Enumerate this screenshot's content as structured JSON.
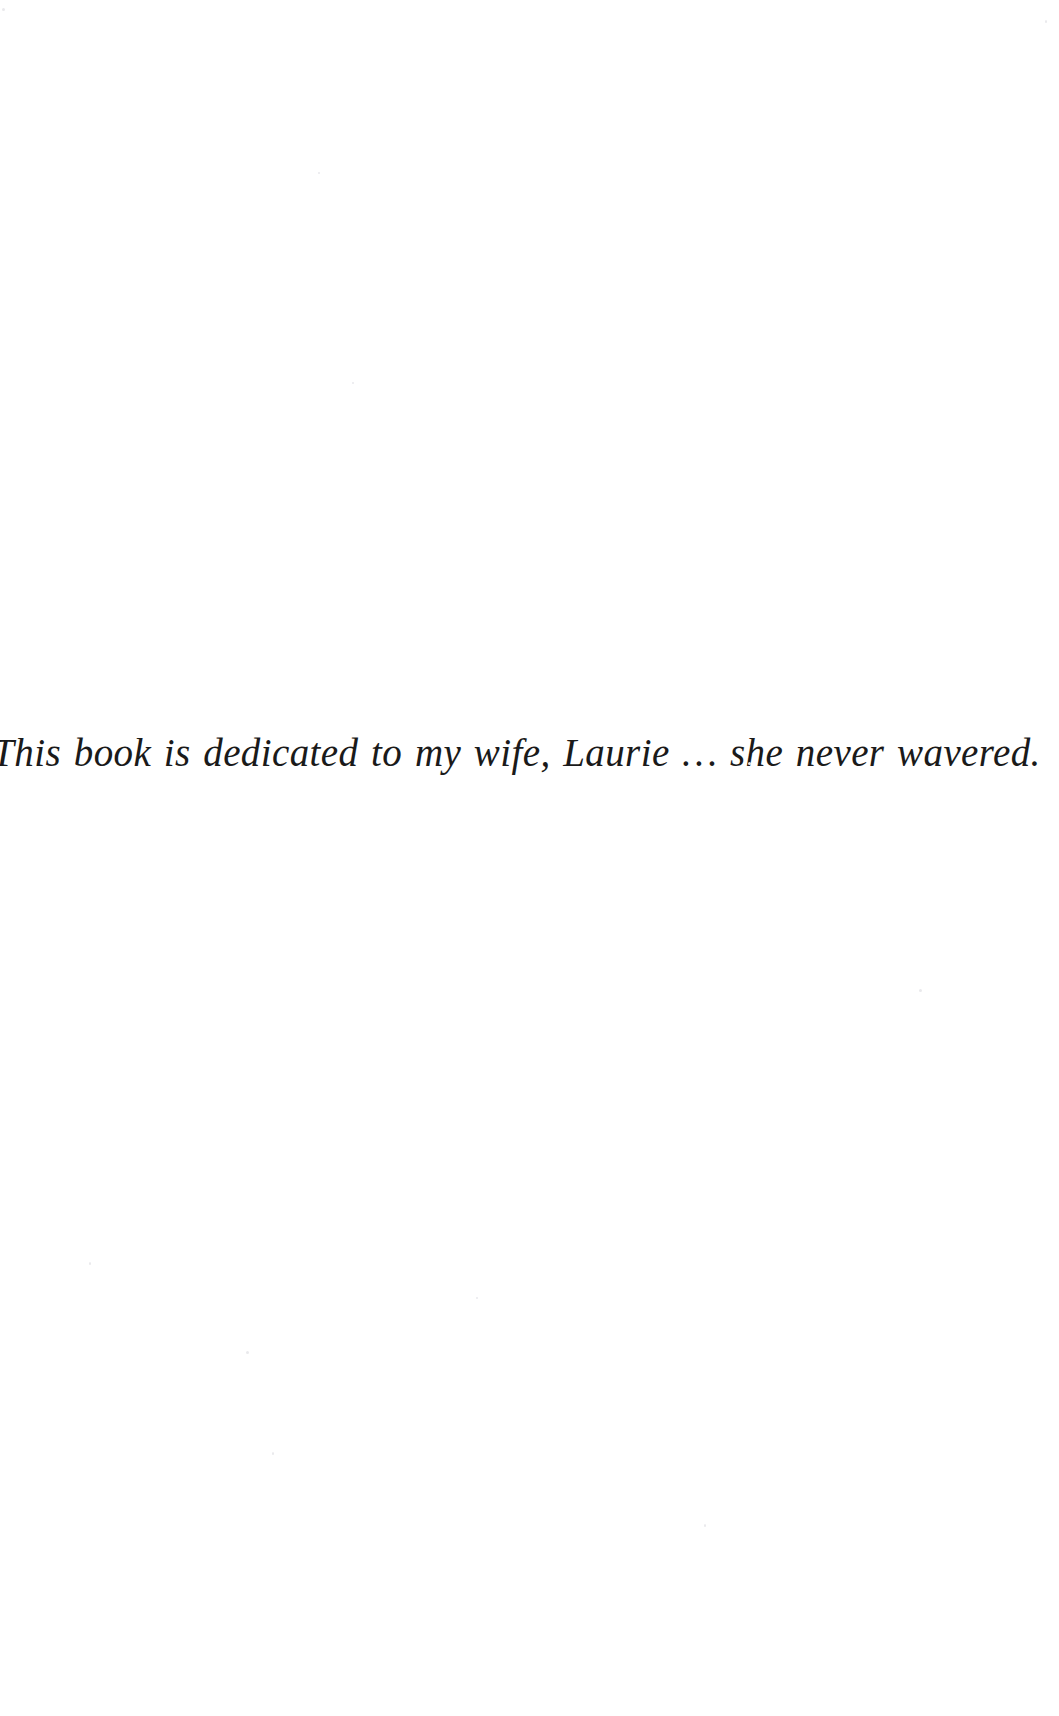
{
  "page": {
    "kind": "book-dedication-page",
    "background_color": "#ffffff",
    "text_color": "#1a1a1a"
  },
  "dedication": {
    "line": "This book is dedicated to my wife, Laurie … she never wavered."
  }
}
